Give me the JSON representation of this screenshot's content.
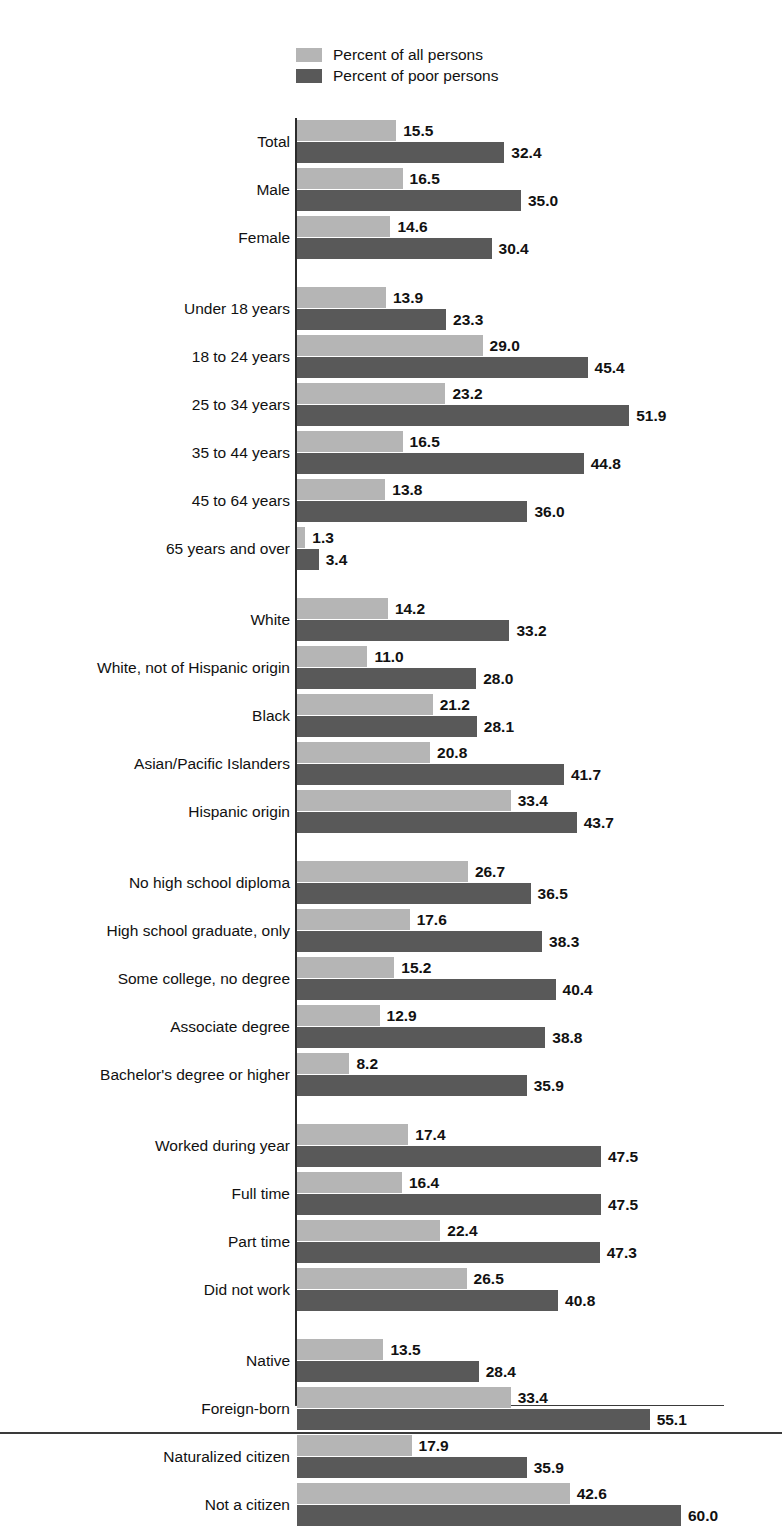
{
  "legend": {
    "items": [
      {
        "label": "Percent of all persons",
        "color": "#b5b5b5",
        "key": "all"
      },
      {
        "label": "Percent of poor persons",
        "color": "#595959",
        "key": "poor"
      }
    ]
  },
  "chart_data": {
    "type": "bar",
    "orientation": "horizontal",
    "title": "",
    "xlabel": "",
    "ylabel": "",
    "xlim": [
      0,
      62
    ],
    "grid": false,
    "legend_position": "top-left",
    "series": [
      {
        "name": "Percent of all persons",
        "color": "#b5b5b5",
        "values": [
          15.5,
          16.5,
          14.6,
          13.9,
          29.0,
          23.2,
          16.5,
          13.8,
          1.3,
          14.2,
          11.0,
          21.2,
          20.8,
          33.4,
          26.7,
          17.6,
          15.2,
          12.9,
          8.2,
          17.4,
          16.4,
          22.4,
          26.5,
          13.5,
          33.4,
          17.9,
          42.6
        ]
      },
      {
        "name": "Percent of poor persons",
        "color": "#595959",
        "values": [
          32.4,
          35.0,
          30.4,
          23.3,
          45.4,
          51.9,
          44.8,
          36.0,
          3.4,
          33.2,
          28.0,
          28.1,
          41.7,
          43.7,
          36.5,
          38.3,
          40.4,
          38.8,
          35.9,
          47.5,
          47.5,
          47.3,
          40.8,
          28.4,
          55.1,
          35.9,
          60.0
        ]
      }
    ],
    "categories": [
      "Total",
      "Male",
      "Female",
      "Under 18 years",
      "18 to 24 years",
      "25 to 34 years",
      "35 to 44 years",
      "45 to 64 years",
      "65 years and over",
      "White",
      "White, not of Hispanic origin",
      "Black",
      "Asian/Pacific Islanders",
      "Hispanic origin",
      "No high school diploma",
      "High school graduate, only",
      "Some college, no degree",
      "Associate degree",
      "Bachelor's degree or higher",
      "Worked during year",
      "Full time",
      "Part time",
      "Did not work",
      "Native",
      "Foreign-born",
      "Naturalized citizen",
      "Not a citizen"
    ],
    "groups": [
      {
        "name": "overall-and-sex",
        "rows": [
          {
            "label": "Total",
            "all": 15.5,
            "poor": 32.4
          },
          {
            "label": "Male",
            "all": 16.5,
            "poor": 35.0
          },
          {
            "label": "Female",
            "all": 14.6,
            "poor": 30.4
          }
        ]
      },
      {
        "name": "age",
        "rows": [
          {
            "label": "Under 18 years",
            "all": 13.9,
            "poor": 23.3
          },
          {
            "label": "18 to 24 years",
            "all": 29.0,
            "poor": 45.4
          },
          {
            "label": "25 to 34 years",
            "all": 23.2,
            "poor": 51.9
          },
          {
            "label": "35 to 44 years",
            "all": 16.5,
            "poor": 44.8
          },
          {
            "label": "45 to 64 years",
            "all": 13.8,
            "poor": 36.0
          },
          {
            "label": "65 years and over",
            "all": 1.3,
            "poor": 3.4
          }
        ]
      },
      {
        "name": "race-and-ethnicity",
        "rows": [
          {
            "label": "White",
            "all": 14.2,
            "poor": 33.2
          },
          {
            "label": "White, not of Hispanic origin",
            "all": 11.0,
            "poor": 28.0
          },
          {
            "label": "Black",
            "all": 21.2,
            "poor": 28.1
          },
          {
            "label": "Asian/Pacific Islanders",
            "all": 20.8,
            "poor": 41.7
          },
          {
            "label": "Hispanic origin",
            "all": 33.4,
            "poor": 43.7
          }
        ]
      },
      {
        "name": "education",
        "rows": [
          {
            "label": "No high school diploma",
            "all": 26.7,
            "poor": 36.5
          },
          {
            "label": "High school graduate, only",
            "all": 17.6,
            "poor": 38.3
          },
          {
            "label": "Some college, no degree",
            "all": 15.2,
            "poor": 40.4
          },
          {
            "label": "Associate degree",
            "all": 12.9,
            "poor": 38.8
          },
          {
            "label": "Bachelor's degree or higher",
            "all": 8.2,
            "poor": 35.9
          }
        ]
      },
      {
        "name": "work-experience",
        "rows": [
          {
            "label": "Worked during year",
            "all": 17.4,
            "poor": 47.5
          },
          {
            "label": "Full time",
            "all": 16.4,
            "poor": 47.5
          },
          {
            "label": "Part time",
            "all": 22.4,
            "poor": 47.3
          },
          {
            "label": "Did not work",
            "all": 26.5,
            "poor": 40.8
          }
        ]
      },
      {
        "name": "nativity-and-citizenship",
        "rows": [
          {
            "label": "Native",
            "all": 13.5,
            "poor": 28.4
          },
          {
            "label": "Foreign-born",
            "all": 33.4,
            "poor": 55.1
          },
          {
            "label": "Naturalized citizen",
            "all": 17.9,
            "poor": 35.9
          },
          {
            "label": "Not a citizen",
            "all": 42.6,
            "poor": 60.0
          }
        ]
      }
    ]
  }
}
